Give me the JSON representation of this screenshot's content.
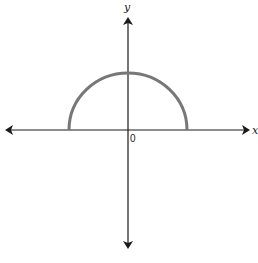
{
  "diagram": {
    "type": "coordinate-plane",
    "axes": {
      "x_label": "x",
      "y_label": "y",
      "origin_label": "0",
      "arrows_both_ends": true
    },
    "curve": {
      "kind": "semicircle",
      "half": "upper",
      "center": [
        0,
        0
      ],
      "color": "#777777"
    },
    "colors": {
      "axis": "#1a1a1a",
      "curve": "#777777",
      "background": "#ffffff"
    }
  }
}
